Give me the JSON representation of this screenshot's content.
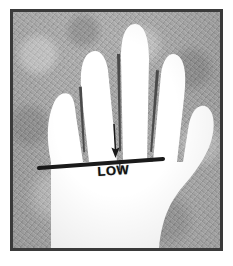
{
  "figure": {
    "background_color": "#a9a9a9",
    "hand_color": "#ffffff",
    "frame_color": "#3a3a3a",
    "ink_color": "#1a1a1a"
  },
  "annotation": {
    "label": "LOW",
    "arrow_direction": "down",
    "marker_name": "head-line-marker",
    "marker_description": "thick horizontal line across the palm"
  },
  "anatomy": {
    "fingers": [
      "index",
      "middle",
      "ring",
      "little"
    ],
    "thumb": "thumb",
    "palm": "palm",
    "wrist": "wrist"
  }
}
